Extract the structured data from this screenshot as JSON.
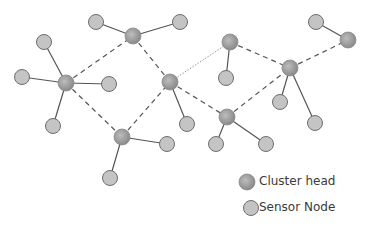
{
  "colors": {
    "cluster_head_fill": "#9e9e9e",
    "sensor_fill": "#c4c4c4",
    "stroke": "#6e6e6e",
    "dashed_link": "#555555",
    "solid_link": "#555555"
  },
  "legend": {
    "cluster_head_label": "Cluster head",
    "sensor_node_label": "Sensor Node"
  },
  "cluster_heads": [
    {
      "id": "A",
      "x": 66,
      "y": 83
    },
    {
      "id": "B",
      "x": 133,
      "y": 36
    },
    {
      "id": "C",
      "x": 170,
      "y": 82
    },
    {
      "id": "D",
      "x": 122,
      "y": 137
    },
    {
      "id": "E",
      "x": 230,
      "y": 42
    },
    {
      "id": "F",
      "x": 290,
      "y": 68
    },
    {
      "id": "G",
      "x": 348,
      "y": 40
    },
    {
      "id": "H",
      "x": 227,
      "y": 117
    }
  ],
  "sensor_nodes": [
    {
      "x": 44,
      "y": 42,
      "ch": "A"
    },
    {
      "x": 22,
      "y": 77,
      "ch": "A"
    },
    {
      "x": 109,
      "y": 84,
      "ch": "A"
    },
    {
      "x": 53,
      "y": 126,
      "ch": "A"
    },
    {
      "x": 96,
      "y": 22,
      "ch": "B"
    },
    {
      "x": 180,
      "y": 22,
      "ch": "B"
    },
    {
      "x": 110,
      "y": 178,
      "ch": "D"
    },
    {
      "x": 167,
      "y": 144,
      "ch": "D"
    },
    {
      "x": 187,
      "y": 124,
      "ch": "C"
    },
    {
      "x": 226,
      "y": 78,
      "ch": "E"
    },
    {
      "x": 316,
      "y": 22,
      "ch": "G"
    },
    {
      "x": 280,
      "y": 102,
      "ch": "F"
    },
    {
      "x": 315,
      "y": 123,
      "ch": "F"
    },
    {
      "x": 216,
      "y": 144,
      "ch": "H"
    },
    {
      "x": 266,
      "y": 144,
      "ch": "H"
    }
  ],
  "dashed_links": [
    [
      "A",
      "B"
    ],
    [
      "B",
      "C"
    ],
    [
      "A",
      "D"
    ],
    [
      "D",
      "C"
    ],
    [
      "C",
      "H"
    ],
    [
      "H",
      "F"
    ],
    [
      "E",
      "F"
    ],
    [
      "F",
      "G"
    ]
  ],
  "dotted_links": [
    [
      "C",
      "E"
    ]
  ]
}
